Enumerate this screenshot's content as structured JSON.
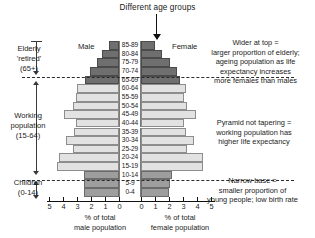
{
  "title": "Different age groups",
  "legend": {
    "male": "Male",
    "female": "Female"
  },
  "left_brackets": [
    {
      "id": "elderly",
      "lines": [
        "Elderly",
        "'retired'",
        "(65+)"
      ]
    },
    {
      "id": "working",
      "lines": [
        "Working",
        "population",
        "(15-64)"
      ]
    },
    {
      "id": "children",
      "lines": [
        "Children",
        "(0-14)"
      ]
    }
  ],
  "annotations": [
    {
      "id": "top",
      "lines": [
        "Wider at top =",
        "larger proportion of elderly;",
        "ageing population as life",
        "expectancy increases",
        "more females than males"
      ]
    },
    {
      "id": "mid",
      "lines": [
        "Pyramid not tapering =",
        "working population has",
        "higher life expectancy"
      ]
    },
    {
      "id": "bot",
      "lines": [
        "Narrow base =",
        "smaller proportion of",
        "young people; low birth rate"
      ]
    }
  ],
  "axis": {
    "left_ticks": [
      "5",
      "4",
      "3",
      "2",
      "1",
      "0"
    ],
    "right_ticks": [
      "0",
      "1",
      "2",
      "3",
      "4",
      "5"
    ],
    "male_caption": [
      "% of total",
      "male population"
    ],
    "female_caption": [
      "% of total",
      "female population"
    ],
    "unit_px": 14,
    "max": 5
  },
  "colors": {
    "elderly": "#6f6f6f",
    "working": "#e2e2e2",
    "children": "#9e9e9e",
    "axis": "#111111",
    "dashed": "#2b2b2b"
  },
  "chart_data": {
    "type": "bar",
    "title": "Different age groups",
    "xlabel": "% of total population",
    "ylabel": "Age group",
    "xlim": [
      0,
      5
    ],
    "grid": false,
    "legend_position": "top-inside",
    "categories": [
      "85-89",
      "80-84",
      "75-79",
      "70-74",
      "65-69",
      "60-64",
      "55-59",
      "50-54",
      "45-49",
      "40-44",
      "35-39",
      "30-34",
      "25-29",
      "20-24",
      "15-19",
      "10-14",
      "5-9",
      "0-4"
    ],
    "group_of_category": [
      "elderly",
      "elderly",
      "elderly",
      "elderly",
      "elderly",
      "working",
      "working",
      "working",
      "working",
      "working",
      "working",
      "working",
      "working",
      "working",
      "working",
      "children",
      "children",
      "children"
    ],
    "series": [
      {
        "name": "Male",
        "values": [
          0.7,
          1.2,
          1.6,
          2.1,
          2.4,
          3.0,
          3.1,
          3.3,
          3.9,
          3.1,
          3.2,
          3.8,
          3.3,
          4.3,
          4.4,
          2.5,
          2.5,
          2.5
        ]
      },
      {
        "name": "Female",
        "values": [
          1.0,
          1.5,
          2.1,
          2.6,
          2.8,
          3.2,
          3.1,
          3.3,
          3.9,
          3.1,
          3.2,
          3.8,
          3.3,
          4.4,
          4.4,
          2.2,
          2.1,
          2.0
        ]
      }
    ]
  }
}
